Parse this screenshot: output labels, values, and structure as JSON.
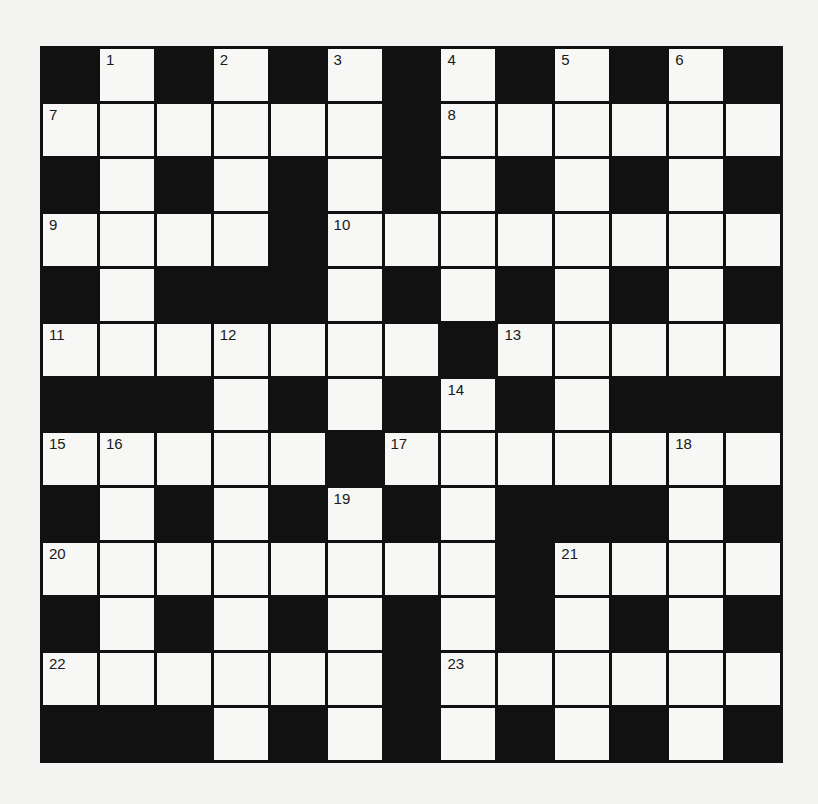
{
  "puzzle": {
    "rows": 13,
    "cols": 13,
    "colors": {
      "block": "#111111",
      "cell": "#f7f7f5",
      "background": "#f4f4f2"
    },
    "grid": [
      [
        "#",
        "1",
        "#",
        "2",
        "#",
        "3",
        "#",
        "4",
        "#",
        "5",
        "#",
        "6",
        "#"
      ],
      [
        "7",
        ".",
        ".",
        ".",
        ".",
        ".",
        "#",
        "8",
        ".",
        ".",
        ".",
        ".",
        "."
      ],
      [
        "#",
        ".",
        "#",
        ".",
        "#",
        ".",
        "#",
        ".",
        "#",
        ".",
        "#",
        ".",
        "#"
      ],
      [
        "9",
        ".",
        ".",
        ".",
        "#",
        "10",
        ".",
        ".",
        ".",
        ".",
        ".",
        ".",
        "."
      ],
      [
        "#",
        ".",
        "#",
        "#",
        "#",
        ".",
        "#",
        ".",
        "#",
        ".",
        "#",
        ".",
        "#"
      ],
      [
        "11",
        ".",
        ".",
        "12",
        ".",
        ".",
        ".",
        "#",
        "13",
        ".",
        ".",
        ".",
        "."
      ],
      [
        "#",
        "#",
        "#",
        ".",
        "#",
        ".",
        "#",
        "14",
        "#",
        ".",
        "#",
        "#",
        "#"
      ],
      [
        "15",
        "16",
        ".",
        ".",
        ".",
        "#",
        "17",
        ".",
        ".",
        ".",
        ".",
        "18",
        "."
      ],
      [
        "#",
        ".",
        "#",
        ".",
        "#",
        "19",
        "#",
        ".",
        "#",
        "#",
        "#",
        ".",
        "#"
      ],
      [
        "20",
        ".",
        ".",
        ".",
        ".",
        ".",
        ".",
        ".",
        "#",
        "21",
        ".",
        ".",
        "."
      ],
      [
        "#",
        ".",
        "#",
        ".",
        "#",
        ".",
        "#",
        ".",
        "#",
        ".",
        "#",
        ".",
        "#"
      ],
      [
        "22",
        ".",
        ".",
        ".",
        ".",
        ".",
        "#",
        "23",
        ".",
        ".",
        ".",
        ".",
        "."
      ],
      [
        "#",
        "#",
        "#",
        ".",
        "#",
        ".",
        "#",
        ".",
        "#",
        ".",
        "#",
        ".",
        "#"
      ]
    ],
    "clue_numbers": [
      "1",
      "2",
      "3",
      "4",
      "5",
      "6",
      "7",
      "8",
      "9",
      "10",
      "11",
      "12",
      "13",
      "14",
      "15",
      "16",
      "17",
      "18",
      "19",
      "20",
      "21",
      "22",
      "23"
    ]
  }
}
